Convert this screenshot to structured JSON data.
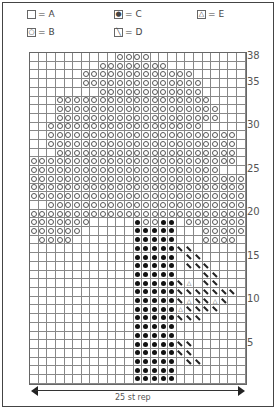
{
  "legend": [
    {
      "symbol": "blank",
      "label": "= A"
    },
    {
      "symbol": "circle",
      "label": "= B"
    },
    {
      "symbol": "dot",
      "label": "= C"
    },
    {
      "symbol": "slash",
      "label": "= D"
    },
    {
      "symbol": "triangle",
      "label": "= E"
    }
  ],
  "chart": {
    "columns": 25,
    "rows": 38,
    "row_labels": [
      "5",
      "10",
      "15",
      "20",
      "25",
      "30",
      "35",
      "38"
    ],
    "repeat_label": "25 st rep",
    "rows_data": {
      "38": "..........BBBB...........",
      "37": "........BBBBBBBB.........",
      "36": "......BBBBBBBBBBBBB......",
      "35": "......BBBBBBBBBBBBBB.....",
      "34": "........BBBBBBBBBBBB.....",
      "33": "...BBBBBBBBBBBBBBBBBB....",
      "32": "...BBBBBBBBBBBBBBBBBBB...",
      "31": "...BBBBBBBBBBBBBBBBBBB...",
      "30": "..BBBBBBBBBBBBBBBBBB.....",
      "29": "..BBBBBBBBBBBBBBBBBBBBBB.",
      "28": "..BBBBBBBBBBBBBBBBBBBBBB.",
      "27": "...BBBBBBBBBBBBBBBBBBBBB.",
      "26": "BBBBBBBBBBBBBBBBBBBBBBBB.",
      "25": "BBBBBBBBBBBBBBBBBBBBBB...",
      "24": "BBBBBBBBBBBBBBBBBBBBBBBBB",
      "23": "BBBBBBBBBBBBBBBBBBBBBBBBB",
      "22": "BBBBBBBBBBBBBBBBBBBBBBBBB",
      "21": "..BBBBBBBBBBBBBBBBBBBBBBB",
      "20": "BBBBBBBBBBBBBBBBBBBBBBBBB",
      "19": "BBBBBBB.....CBBCC.BBBBBBB",
      "18": "BBBBBB......CCCCC...BBBBB",
      "17": ".BBBB.......CCCCC...BBBB.",
      "16": "............CCCCCDD......",
      "15": "............CCCCC.DD.....",
      "14": "............CCCCC.DDD....",
      "13": "............CCCCC...DD...",
      "12": "............CCCCCDE.DD...",
      "11": "............CCCCCDDDDDDD.",
      "10": "............CCCCCDEDDED..",
      "9": "............CCCCCEDDDD...",
      "8": "............CCCCCDDD.....",
      "7": "............CCCCC........",
      "6": "............CCCCC........",
      "5": "............CCCCCDD......",
      "4": "............CCCCCDD......",
      "3": "............CCCCC.DD.....",
      "2": "............CCCCC........",
      "1": "............CCCCC........"
    }
  }
}
